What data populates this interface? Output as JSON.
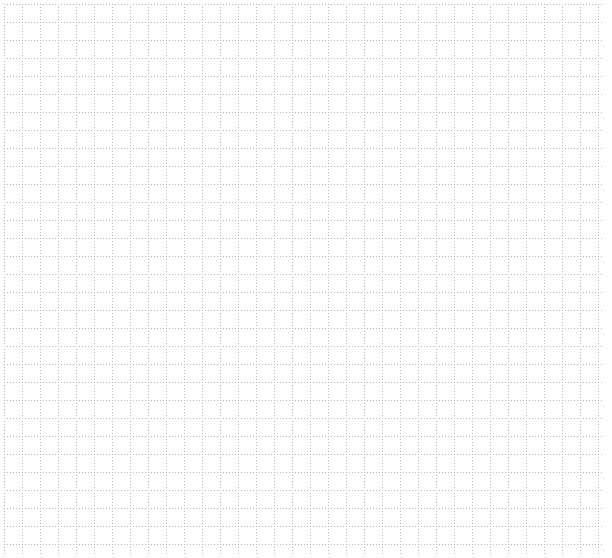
{
  "canvas": {
    "type": "empty-grid",
    "width": 612,
    "height": 558,
    "grid": {
      "offset_x": 4,
      "offset_y": 4,
      "spacing": 18,
      "end_x": 604,
      "end_y": 556,
      "line_color": "#b8b8b8",
      "line_style": "dotted"
    }
  }
}
